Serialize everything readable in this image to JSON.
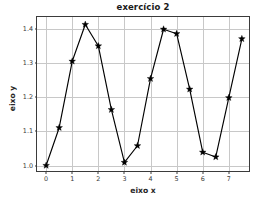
{
  "chart_data": {
    "type": "line",
    "title": "exercício 2",
    "xlabel": "eixo x",
    "ylabel": "eixo y",
    "x": [
      0,
      0.5,
      1,
      1.5,
      2,
      2.5,
      3,
      3.5,
      4,
      4.5,
      5,
      5.5,
      6,
      6.5,
      7,
      7.5
    ],
    "values": [
      1.0,
      1.111,
      1.306,
      1.414,
      1.351,
      1.164,
      1.009,
      1.058,
      1.255,
      1.4,
      1.387,
      1.224,
      1.039,
      1.025,
      1.199,
      1.372
    ],
    "series": [
      {
        "name": "f(x)",
        "values": [
          1.0,
          1.111,
          1.306,
          1.414,
          1.351,
          1.164,
          1.009,
          1.058,
          1.255,
          1.4,
          1.387,
          1.224,
          1.039,
          1.025,
          1.199,
          1.372
        ]
      }
    ],
    "xlim": [
      -0.35,
      7.85
    ],
    "ylim": [
      0.978,
      1.436
    ],
    "xticks": [
      0,
      1,
      2,
      3,
      4,
      5,
      6,
      7
    ],
    "xtick_labels": [
      "0",
      "1",
      "2",
      "3",
      "4",
      "5",
      "6",
      "7"
    ],
    "yticks": [
      1.0,
      1.1,
      1.2,
      1.3,
      1.4
    ],
    "ytick_labels": [
      "1.0",
      "1.1",
      "1.2",
      "1.3",
      "1.4"
    ],
    "grid": true,
    "legend": null,
    "marker": "star",
    "line_color": "#000000",
    "marker_color": "#000000",
    "grid_color": "#c8c8c8",
    "background": "#ffffff"
  }
}
